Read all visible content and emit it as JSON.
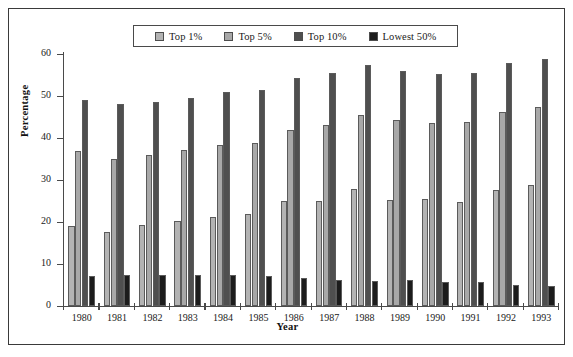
{
  "chart_data": {
    "type": "bar",
    "title": "",
    "xlabel": "Year",
    "ylabel": "Percentage",
    "categories": [
      "1980",
      "1981",
      "1982",
      "1983",
      "1984",
      "1985",
      "1986",
      "1987",
      "1988",
      "1989",
      "1990",
      "1991",
      "1992",
      "1993"
    ],
    "ylim": [
      0,
      60
    ],
    "yticks": [
      0,
      10,
      20,
      30,
      40,
      50,
      60
    ],
    "grid": false,
    "legend_position": "top-center",
    "series": [
      {
        "name": "Top 1%",
        "color": "#b3b3b3",
        "values": [
          19.0,
          17.7,
          19.3,
          20.3,
          21.2,
          21.8,
          25.1,
          24.9,
          27.8,
          25.3,
          25.4,
          24.8,
          27.7,
          28.9
        ]
      },
      {
        "name": "Top 5%",
        "color": "#a8a8a8",
        "values": [
          37.0,
          35.0,
          36.0,
          37.2,
          38.3,
          38.9,
          41.9,
          43.1,
          45.4,
          44.2,
          43.6,
          43.7,
          46.1,
          47.4
        ]
      },
      {
        "name": "Top 10%",
        "color": "#4f4f4f",
        "values": [
          49.0,
          48.0,
          48.5,
          49.6,
          50.9,
          51.5,
          54.2,
          55.5,
          57.3,
          55.9,
          55.3,
          55.4,
          57.8,
          58.9
        ]
      },
      {
        "name": "Lowest 50%",
        "color": "#1c1c1c",
        "values": [
          7.2,
          7.4,
          7.5,
          7.5,
          7.5,
          7.2,
          6.6,
          6.2,
          5.9,
          6.2,
          5.8,
          5.6,
          5.1,
          4.7
        ]
      }
    ]
  },
  "legend": {
    "items": [
      {
        "label": "Top 1%",
        "color": "#b3b3b3"
      },
      {
        "label": "Top 5%",
        "color": "#a8a8a8"
      },
      {
        "label": "Top 10%",
        "color": "#4f4f4f"
      },
      {
        "label": "Lowest 50%",
        "color": "#1c1c1c"
      }
    ]
  },
  "axes": {
    "y_title": "Percentage",
    "x_title": "Year"
  }
}
